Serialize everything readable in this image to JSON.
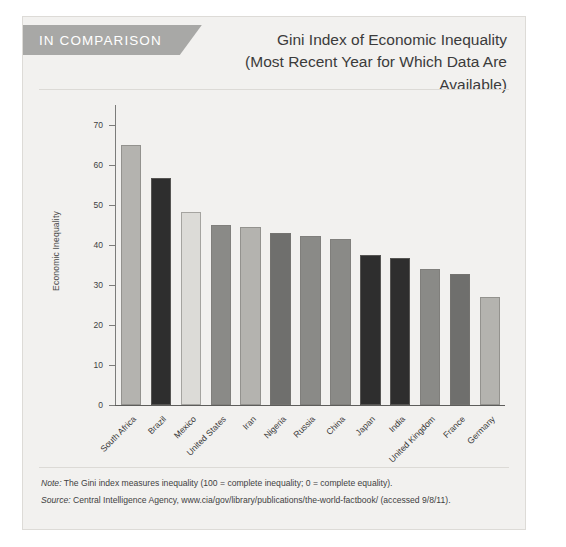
{
  "header": {
    "banner_label": "IN COMPARISON",
    "title_line1": "Gini Index of Economic Inequality",
    "title_line2": "(Most Recent Year for Which Data Are Available)"
  },
  "footer": {
    "note_label": "Note:",
    "note_text": " The Gini index measures inequality (100 = complete inequality; 0 = complete equality).",
    "source_label": "Source:",
    "source_text": " Central Intelligence Agency, www.cia/gov/library/publications/the-world-factbook/ (accessed 9/8/11)."
  },
  "colors": {
    "banner_bg": "#a8a8a6",
    "panel_bg": "#f2f1ef",
    "bar_light": "#dcdbd7",
    "bar_mid": "#b4b3af",
    "bar_dark": "#8a8a87",
    "bar_darker": "#6f6f6d",
    "bar_black": "#2e2e2e"
  },
  "chart_data": {
    "type": "bar",
    "title": "Gini Index of Economic Inequality (Most Recent Year for Which Data Are Available)",
    "xlabel": "",
    "ylabel": "Economic Inequality",
    "ylim": [
      0,
      75
    ],
    "yticks": [
      0,
      10,
      20,
      30,
      40,
      50,
      60,
      70
    ],
    "grid": false,
    "legend": "none",
    "categories": [
      "South Africa",
      "Brazil",
      "Mexico",
      "United States",
      "Iran",
      "Nigeria",
      "Russia",
      "China",
      "Japan",
      "India",
      "United Kingdom",
      "France",
      "Germany"
    ],
    "values": [
      65,
      56.7,
      48.2,
      45,
      44.5,
      43,
      42.3,
      41.5,
      37.6,
      36.8,
      34,
      32.7,
      27
    ],
    "bar_colors": [
      "#b4b3af",
      "#2e2e2e",
      "#dcdbd7",
      "#8a8a87",
      "#b4b3af",
      "#6f6f6d",
      "#8a8a87",
      "#8a8a87",
      "#2e2e2e",
      "#2e2e2e",
      "#8a8a87",
      "#6f6f6d",
      "#b4b3af"
    ]
  }
}
